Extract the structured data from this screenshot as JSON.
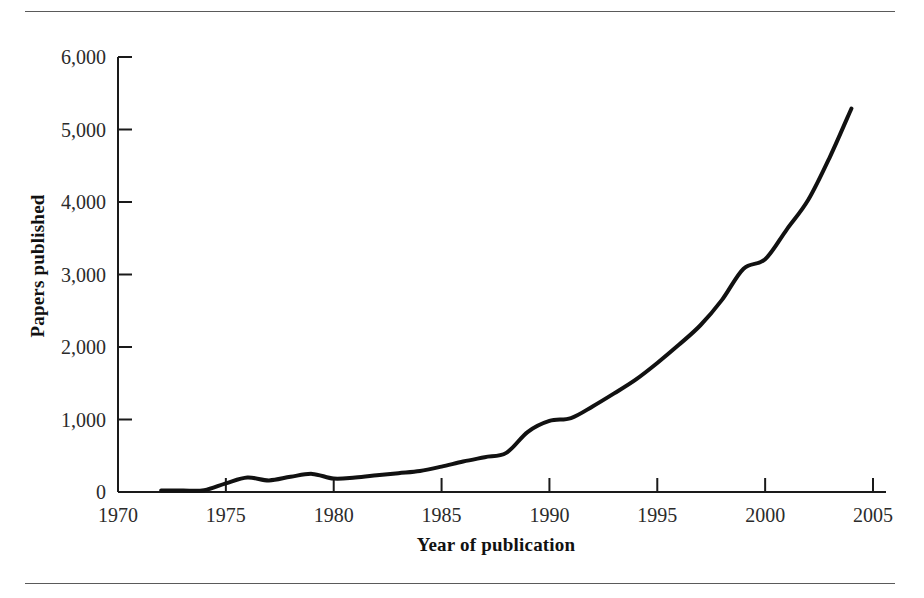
{
  "figure": {
    "has_top_rule": true,
    "has_bottom_rule": true,
    "rule_color": "#5a5a5a",
    "background": "#ffffff"
  },
  "chart_data": {
    "type": "line",
    "title": "",
    "subtitle": "",
    "xlabel": "Year of publication",
    "ylabel": "Papers published",
    "xlim": [
      1970,
      2005
    ],
    "ylim": [
      0,
      6000
    ],
    "grid": false,
    "legend": null,
    "line_color": "#111111",
    "line_width": 4,
    "xticks": [
      1970,
      1975,
      1980,
      1985,
      1990,
      1995,
      2000,
      2005
    ],
    "xticklabels": [
      "1970",
      "1975",
      "1980",
      "1985",
      "1990",
      "1995",
      "2000",
      "2005"
    ],
    "yticks": [
      0,
      1000,
      2000,
      3000,
      4000,
      5000,
      6000
    ],
    "yticklabels": [
      "0",
      "1,000",
      "2,000",
      "3,000",
      "4,000",
      "5,000",
      "6,000"
    ],
    "series": [
      {
        "name": "Papers published",
        "x": [
          1972,
          1973,
          1974,
          1975,
          1976,
          1977,
          1978,
          1979,
          1980,
          1981,
          1982,
          1983,
          1984,
          1985,
          1986,
          1987,
          1988,
          1989,
          1990,
          1991,
          1992,
          1993,
          1994,
          1995,
          1996,
          1997,
          1998,
          1999,
          2000,
          2001,
          2002,
          2003,
          2004
        ],
        "values": [
          20,
          20,
          25,
          120,
          200,
          160,
          210,
          250,
          185,
          200,
          230,
          260,
          290,
          350,
          420,
          480,
          540,
          830,
          980,
          1020,
          1180,
          1360,
          1550,
          1780,
          2030,
          2300,
          2650,
          3080,
          3210,
          3620,
          4030,
          4620,
          5290
        ]
      }
    ]
  }
}
